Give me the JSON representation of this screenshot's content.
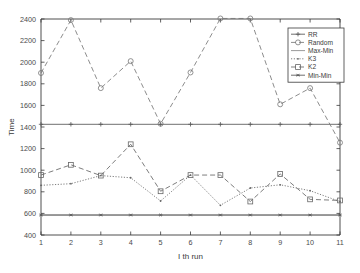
{
  "chart_data": {
    "type": "line",
    "title": "",
    "xlabel": "I th run",
    "ylabel": "Time",
    "x": [
      1,
      2,
      3,
      4,
      5,
      6,
      7,
      8,
      9,
      10,
      11
    ],
    "xlim": [
      1,
      11
    ],
    "ylim": [
      400,
      2400
    ],
    "yticks": [
      400,
      600,
      800,
      1000,
      1200,
      1400,
      1600,
      1800,
      2000,
      2200,
      2400
    ],
    "xticks": [
      1,
      2,
      3,
      4,
      5,
      6,
      7,
      8,
      9,
      10,
      11
    ],
    "grid": false,
    "legend_position": "upper right",
    "series": [
      {
        "name": "RR",
        "marker": "plus",
        "linestyle": "solid",
        "color": "#555555",
        "values": [
          1425,
          1425,
          1425,
          1425,
          1425,
          1425,
          1425,
          1425,
          1425,
          1425,
          1425
        ]
      },
      {
        "name": "Random",
        "marker": "circle",
        "linestyle": "dashed",
        "color": "#777777",
        "values": [
          1900,
          2390,
          1760,
          2010,
          1430,
          1905,
          2405,
          2405,
          1610,
          1760,
          1255
        ]
      },
      {
        "name": "Max-Min",
        "marker": "none",
        "linestyle": "solid",
        "color": "#888888",
        "values": [
          585,
          585,
          585,
          585,
          585,
          585,
          585,
          585,
          585,
          585,
          585
        ]
      },
      {
        "name": "K3",
        "marker": "dot",
        "linestyle": "dotted",
        "color": "#666666",
        "values": [
          860,
          875,
          950,
          930,
          715,
          955,
          675,
          835,
          865,
          810,
          710
        ]
      },
      {
        "name": "K2",
        "marker": "square",
        "linestyle": "dashed",
        "color": "#666666",
        "values": [
          955,
          1050,
          950,
          1240,
          805,
          955,
          955,
          710,
          965,
          730,
          720
        ]
      },
      {
        "name": "Min-Min",
        "marker": "asterisk",
        "linestyle": "solid",
        "color": "#555555",
        "values": [
          585,
          585,
          585,
          585,
          585,
          585,
          585,
          585,
          585,
          585,
          585
        ]
      }
    ],
    "tick_labels": {
      "y": [
        "400",
        "600",
        "800",
        "1000",
        "1200",
        "1400",
        "1600",
        "1800",
        "2000",
        "2200",
        "2400"
      ],
      "x": [
        "1",
        "2",
        "3",
        "4",
        "5",
        "6",
        "7",
        "8",
        "9",
        "10",
        "11"
      ]
    },
    "legend_entries": [
      "RR",
      "Random",
      "Max-Min",
      "K3",
      "K2",
      "Min-Min"
    ]
  }
}
